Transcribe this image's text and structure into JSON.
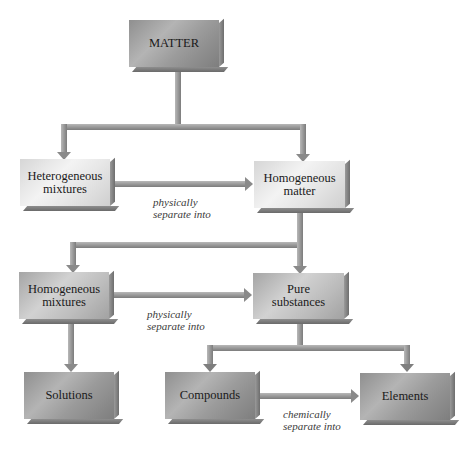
{
  "diagram": {
    "nodes": {
      "matter": {
        "label": "MATTER"
      },
      "heterogeneous_mixtures": {
        "line1": "Heterogeneous",
        "line2": "mixtures"
      },
      "homogeneous_matter": {
        "line1": "Homogeneous",
        "line2": "matter"
      },
      "homogeneous_mixtures": {
        "line1": "Homogeneous",
        "line2": "mixtures"
      },
      "pure_substances": {
        "line1": "Pure",
        "line2": "substances"
      },
      "solutions": {
        "label": "Solutions"
      },
      "compounds": {
        "label": "Compounds"
      },
      "elements": {
        "label": "Elements"
      }
    },
    "edge_labels": {
      "hetero_to_homo": {
        "line1": "physically",
        "line2": "separate into"
      },
      "mixtures_to_pure": {
        "line1": "physically",
        "line2": "separate into"
      },
      "compounds_to_elements": {
        "line1": "chemically",
        "line2": "separate into"
      }
    },
    "edges": [
      {
        "from": "MATTER",
        "to": "Heterogeneous mixtures"
      },
      {
        "from": "MATTER",
        "to": "Homogeneous matter"
      },
      {
        "from": "Heterogeneous mixtures",
        "to": "Homogeneous matter",
        "label": "physically separate into"
      },
      {
        "from": "Homogeneous matter",
        "to": "Homogeneous mixtures"
      },
      {
        "from": "Homogeneous matter",
        "to": "Pure substances"
      },
      {
        "from": "Homogeneous mixtures",
        "to": "Pure substances",
        "label": "physically separate into"
      },
      {
        "from": "Homogeneous mixtures",
        "to": "Solutions"
      },
      {
        "from": "Pure substances",
        "to": "Compounds"
      },
      {
        "from": "Pure substances",
        "to": "Elements"
      },
      {
        "from": "Compounds",
        "to": "Elements",
        "label": "chemically separate into"
      }
    ]
  },
  "colors": {
    "connector": "#9c9c9c",
    "connector_dark": "#7a7a7a",
    "text": "#1a1a1a"
  }
}
